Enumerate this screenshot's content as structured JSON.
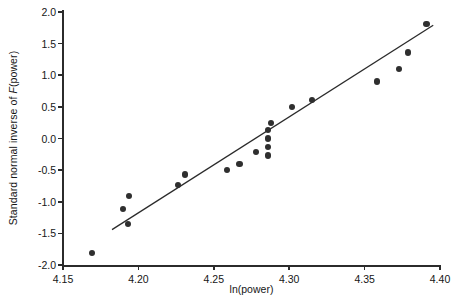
{
  "chart_data": {
    "type": "scatter",
    "title": "",
    "xlabel": "ln(power)",
    "ylabel": "Standard normal inverse of F(power)",
    "ylabel_parts": {
      "prefix": "Standard normal inverse of ",
      "italic": "F",
      "suffix": "(power)"
    },
    "xlim": [
      4.15,
      4.4
    ],
    "ylim": [
      -2.0,
      2.0
    ],
    "xticks": [
      "4.15",
      "4.20",
      "4.25",
      "4.30",
      "4.35",
      "4.40"
    ],
    "xtick_values": [
      4.15,
      4.2,
      4.25,
      4.3,
      4.35,
      4.4
    ],
    "yticks": [
      "2.0",
      "1.5",
      "1.0",
      "0.5",
      "0.0",
      "-0.5",
      "-1.0",
      "-1.5",
      "-2.0"
    ],
    "ytick_values": [
      2.0,
      1.5,
      1.0,
      0.5,
      0.0,
      -0.5,
      -1.0,
      -1.5,
      -2.0
    ],
    "grid": false,
    "legend": false,
    "marker_color": "#2f2f2f",
    "line_color": "#2b2b2b",
    "axis_color": "#2b2b2b",
    "points": [
      {
        "x": 4.169,
        "y": -1.81
      },
      {
        "x": 4.193,
        "y": -1.35
      },
      {
        "x": 4.19,
        "y": -1.12
      },
      {
        "x": 4.194,
        "y": -0.91
      },
      {
        "x": 4.226,
        "y": -0.73
      },
      {
        "x": 4.231,
        "y": -0.57
      },
      {
        "x": 4.259,
        "y": -0.5
      },
      {
        "x": 4.267,
        "y": -0.4
      },
      {
        "x": 4.278,
        "y": -0.21
      },
      {
        "x": 4.286,
        "y": -0.27
      },
      {
        "x": 4.286,
        "y": -0.13
      },
      {
        "x": 4.286,
        "y": 0.0
      },
      {
        "x": 4.286,
        "y": 0.13
      },
      {
        "x": 4.288,
        "y": 0.25
      },
      {
        "x": 4.302,
        "y": 0.5
      },
      {
        "x": 4.315,
        "y": 0.61
      },
      {
        "x": 4.358,
        "y": 0.9
      },
      {
        "x": 4.373,
        "y": 1.1
      },
      {
        "x": 4.379,
        "y": 1.36
      },
      {
        "x": 4.391,
        "y": 1.81
      }
    ],
    "fit_line": {
      "x0": 4.1825,
      "y0": -1.44,
      "x1": 4.3955,
      "y1": 1.79
    }
  }
}
